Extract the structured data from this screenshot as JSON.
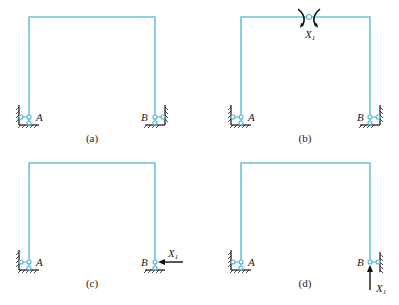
{
  "panels": [
    {
      "id": "a",
      "caption": "(a)",
      "left_label": "A",
      "right_label": "B",
      "redundant": null
    },
    {
      "id": "b",
      "caption": "(b)",
      "left_label": "A",
      "right_label": "B",
      "redundant": {
        "type": "moment-pair",
        "label": "X",
        "sub": "1",
        "location": "top-beam-midspan-hinge"
      }
    },
    {
      "id": "c",
      "caption": "(c)",
      "left_label": "A",
      "right_label": "B",
      "redundant": {
        "type": "horizontal-force",
        "label": "X",
        "sub": "1",
        "location": "support-B"
      }
    },
    {
      "id": "d",
      "caption": "(d)",
      "left_label": "A",
      "right_label": "B",
      "redundant": {
        "type": "vertical-force",
        "label": "X",
        "sub": "1",
        "location": "support-B"
      }
    }
  ],
  "colors": {
    "member": "#6cc4dc",
    "pin": "#4fb3d4",
    "ink": "#222222"
  }
}
